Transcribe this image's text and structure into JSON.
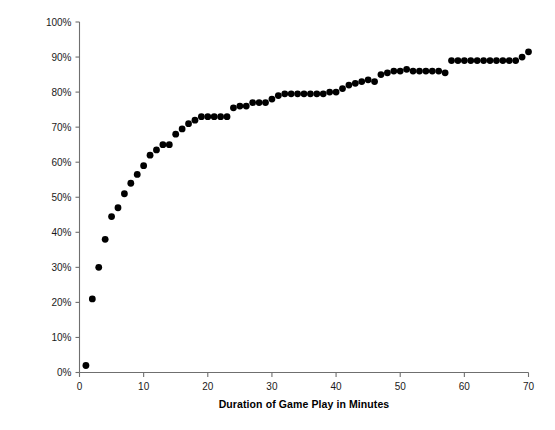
{
  "chart_data": {
    "type": "scatter",
    "title": "",
    "xlabel": "Duration of Game Play in Minutes",
    "ylabel": "Cumulative Percentage of Games with All Content Observed",
    "xlim": [
      0,
      70
    ],
    "ylim": [
      0,
      100
    ],
    "xticks": [
      0,
      10,
      20,
      30,
      40,
      50,
      60,
      70
    ],
    "xticklabels": [
      "0",
      "10",
      "20",
      "30",
      "40",
      "50",
      "60",
      "70"
    ],
    "yticks": [
      0,
      10,
      20,
      30,
      40,
      50,
      60,
      70,
      80,
      90,
      100
    ],
    "yticklabels": [
      "0%",
      "10%",
      "20%",
      "30%",
      "40%",
      "50%",
      "60%",
      "70%",
      "80%",
      "90%",
      "100%"
    ],
    "grid": false,
    "legend": null,
    "marker": "circle",
    "marker_color": "#000000",
    "marker_size_px": 4.4,
    "series": [
      {
        "name": "Cumulative percentage of games with all content observed",
        "x": [
          1,
          2,
          3,
          4,
          5,
          6,
          7,
          8,
          9,
          10,
          11,
          12,
          13,
          14,
          15,
          16,
          17,
          18,
          19,
          20,
          21,
          22,
          23,
          24,
          25,
          26,
          27,
          28,
          29,
          30,
          31,
          32,
          33,
          34,
          35,
          36,
          37,
          38,
          39,
          40,
          41,
          42,
          43,
          44,
          45,
          46,
          47,
          48,
          49,
          50,
          51,
          52,
          53,
          54,
          55,
          56,
          57,
          58,
          59,
          60,
          61,
          62,
          63,
          64,
          65,
          66,
          67,
          68,
          69,
          70
        ],
        "y": [
          2,
          21,
          30,
          38,
          44.5,
          47,
          51,
          54,
          56.5,
          59,
          62,
          63.5,
          65,
          65,
          68,
          69.5,
          71,
          72,
          73,
          73,
          73,
          73,
          73,
          75.5,
          76,
          76,
          77,
          77,
          77,
          78,
          79,
          79.5,
          79.5,
          79.5,
          79.5,
          79.5,
          79.5,
          79.5,
          80,
          80,
          81,
          82,
          82.5,
          83,
          83.5,
          83,
          85,
          85.5,
          86,
          86,
          86.5,
          86,
          86,
          86,
          86,
          86,
          85.5,
          89,
          89,
          89,
          89,
          89,
          89,
          89,
          89,
          89,
          89,
          89,
          90,
          91.5
        ]
      }
    ]
  },
  "axes": {
    "x_axis_name": "x-axis",
    "y_axis_name": "y-axis"
  }
}
